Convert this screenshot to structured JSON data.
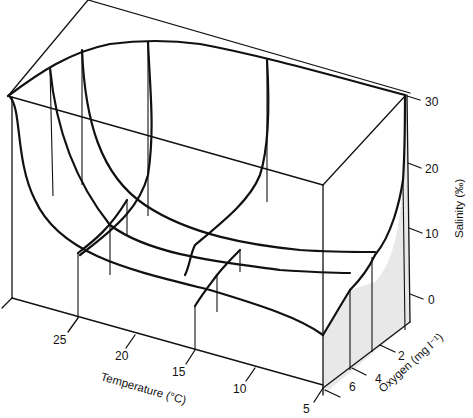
{
  "diagram": {
    "type": "3d-response-surface",
    "axes": {
      "temperature": {
        "title": "Temperature (°C)",
        "ticks": [
          "25",
          "20",
          "15",
          "10",
          "5"
        ]
      },
      "oxygen": {
        "title": "Oxygen (mg l⁻¹)",
        "ticks": [
          "2",
          "4",
          "6"
        ]
      },
      "salinity": {
        "title": "Salinity (‰)",
        "ticks": [
          "30",
          "20",
          "10",
          "0"
        ]
      }
    },
    "colors": {
      "line": "#111111",
      "shade": "#e8e8e8",
      "background": "#ffffff"
    }
  }
}
